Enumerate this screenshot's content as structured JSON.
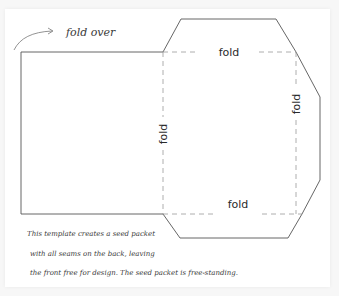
{
  "diagram": {
    "annotation": {
      "text": "fold over"
    },
    "fold_labels": {
      "top": "fold",
      "left": "fold",
      "right": "fold",
      "bottom": "fold"
    },
    "description": {
      "line1": "This template creates a seed packet",
      "line2": "with all seams on the back, leaving",
      "line3": "the front free for design. The seed packet is free-standing."
    },
    "colors": {
      "outline": "#555555",
      "fold_line": "#9a9a9a",
      "text": "#2a2a2a",
      "background": "#ffffff"
    }
  }
}
